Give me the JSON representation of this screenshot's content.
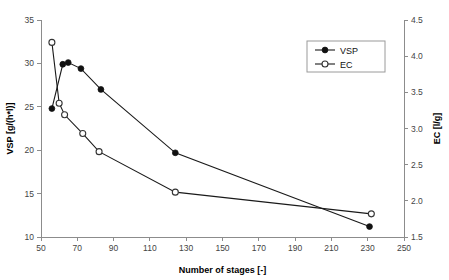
{
  "chart_data": {
    "type": "line",
    "title": "",
    "xlabel": "Number of stages [-]",
    "ylabel": "VSP [g/(h*l)]",
    "y2label": "EC [l/g]",
    "xlim": [
      50,
      250
    ],
    "ylim": [
      10,
      35
    ],
    "y2lim": [
      1.5,
      4.5
    ],
    "xticks": [
      50,
      70,
      90,
      110,
      130,
      150,
      170,
      190,
      210,
      230,
      250
    ],
    "xtick_labels": [
      "50",
      "70",
      "90",
      "110",
      "130",
      "150",
      "170",
      "190",
      "210",
      "230",
      "250"
    ],
    "yticks": [
      10,
      15,
      20,
      25,
      30,
      35
    ],
    "ytick_labels": [
      "10",
      "15",
      "20",
      "25",
      "30",
      "35"
    ],
    "y2ticks": [
      1.5,
      2.0,
      2.5,
      3.0,
      3.5,
      4.0,
      4.5
    ],
    "y2tick_labels": [
      "1.5",
      "2.0",
      "2.5",
      "3.0",
      "3.5",
      "4.0",
      "4.5"
    ],
    "grid": false,
    "legend_position": "top-right",
    "series": [
      {
        "name": "VSP",
        "axis": "left",
        "marker": "filled-circle",
        "x": [
          56,
          62,
          65,
          72,
          83,
          124,
          231
        ],
        "values": [
          24.8,
          29.9,
          30.1,
          29.4,
          27.0,
          19.7,
          11.2
        ]
      },
      {
        "name": "EC",
        "axis": "right",
        "marker": "open-circle",
        "x": [
          56,
          60,
          63,
          73,
          82,
          124,
          232
        ],
        "values": [
          4.19,
          3.35,
          3.19,
          2.93,
          2.68,
          2.12,
          1.82
        ]
      }
    ]
  },
  "legend": {
    "entries": [
      {
        "label": "VSP",
        "marker": "filled-circle"
      },
      {
        "label": "EC",
        "marker": "open-circle"
      }
    ]
  },
  "colors": {
    "series_line": "#1a1a1a",
    "axis": "#8c8c8c",
    "text": "#444444",
    "background": "#ffffff"
  }
}
